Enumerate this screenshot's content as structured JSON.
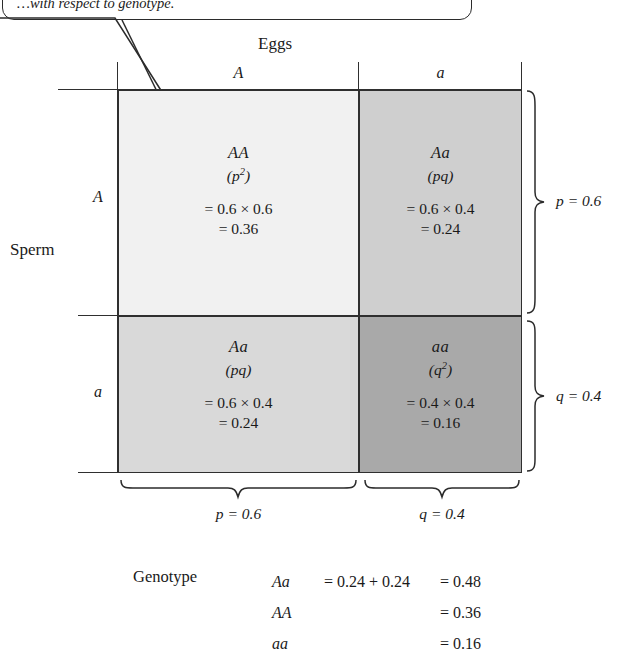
{
  "callout": {
    "text": "…with respect to genotype.",
    "visible_fragment": "respect to genotype."
  },
  "axes": {
    "columns_title": "Eggs",
    "rows_title": "Sperm",
    "column_headers": [
      "A",
      "a"
    ],
    "row_headers": [
      "A",
      "a"
    ]
  },
  "punnett": {
    "cells": [
      {
        "id": "AA",
        "genotype": "AA",
        "alleles_open": "(",
        "alleles_base": "p",
        "alleles_sup": "2",
        "alleles_close": ")",
        "product": "= 0.6 × 0.6",
        "result": "= 0.36",
        "fill": "#f1f1f1"
      },
      {
        "id": "Aa-top-right",
        "genotype": "Aa",
        "alleles_open": "(",
        "alleles_base": "pq",
        "alleles_sup": "",
        "alleles_close": ")",
        "product": "= 0.6 × 0.4",
        "result": "= 0.24",
        "fill": "#cfcfcf"
      },
      {
        "id": "Aa-bottom-left",
        "genotype": "Aa",
        "alleles_open": "(",
        "alleles_base": "pq",
        "alleles_sup": "",
        "alleles_close": ")",
        "product": "= 0.6 × 0.4",
        "result": "= 0.24",
        "fill": "#d9d9d9"
      },
      {
        "id": "aa",
        "genotype": "aa",
        "alleles_open": "(",
        "alleles_base": "q",
        "alleles_sup": "2",
        "alleles_close": ")",
        "product": "= 0.4 × 0.4",
        "result": "= 0.16",
        "fill": "#a9a9a9"
      }
    ]
  },
  "braces": {
    "right_top_label": "p = 0.6",
    "right_bottom_label": "q = 0.4",
    "bottom_left_label": "p = 0.6",
    "bottom_right_label": "q = 0.4"
  },
  "summary": {
    "title": "Genotype",
    "rows": [
      {
        "genotype": "Aa",
        "middle": "= 0.24 + 0.24",
        "total": "= 0.48"
      },
      {
        "genotype": "AA",
        "middle": "",
        "total": "= 0.36"
      },
      {
        "genotype": "aa",
        "middle": "",
        "total": "= 0.16"
      }
    ]
  },
  "colors": {
    "line": "#2f2f2f",
    "text": "#1a1a1a",
    "background": "#ffffff"
  }
}
